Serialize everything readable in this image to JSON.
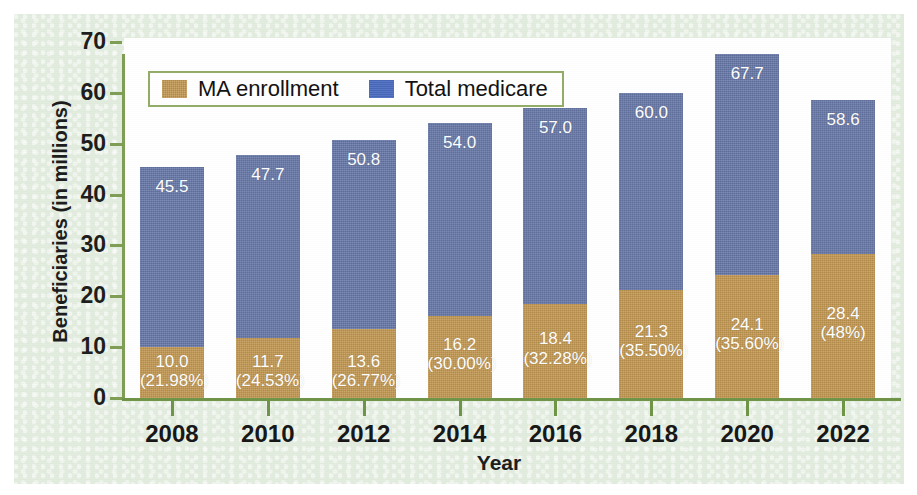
{
  "figure": {
    "background_color": "#e3eddf",
    "plot_background_color": "#ffffff",
    "axis_color": "#7f9e54"
  },
  "legend": {
    "position": "top-left-inside",
    "border_color": "#93ad68",
    "items": [
      {
        "label": "MA enrollment",
        "color": "#c3974f",
        "swatch": "tan-swatch-icon"
      },
      {
        "label": "Total medicare",
        "color": "#4a6bc0",
        "swatch": "blue-swatch-icon"
      }
    ]
  },
  "chart_data": {
    "type": "bar",
    "subtype": "stacked",
    "title": "",
    "xlabel": "Year",
    "ylabel": "Beneficiaries (in millions)",
    "ylim": [
      0,
      70
    ],
    "yticks": [
      0,
      10,
      20,
      30,
      40,
      50,
      60,
      70
    ],
    "ytick_labels": [
      "0",
      "10",
      "20",
      "30",
      "40",
      "50",
      "60",
      "70"
    ],
    "grid": false,
    "legend_position": "upper left",
    "categories": [
      "2008",
      "2010",
      "2012",
      "2014",
      "2016",
      "2018",
      "2020",
      "2022"
    ],
    "series": [
      {
        "name": "MA enrollment",
        "color": "#c3974f",
        "values": [
          10.0,
          11.7,
          13.6,
          16.2,
          18.4,
          21.3,
          24.1,
          28.4
        ],
        "value_labels": [
          "10.0",
          "11.7",
          "13.6",
          "16.2",
          "18.4",
          "21.3",
          "24.1",
          "28.4"
        ],
        "percent_labels": [
          "(21.98%)",
          "(24.53%)",
          "(26.77%)",
          "(30.00%)",
          "(32.28%)",
          "(35.50%)",
          "(35.60%)",
          "(48%)"
        ],
        "percents": [
          21.98,
          24.53,
          26.77,
          30.0,
          32.28,
          35.5,
          35.6,
          48.0
        ]
      },
      {
        "name": "Total medicare",
        "color": "#6778a8",
        "values": [
          45.5,
          47.7,
          50.8,
          54.0,
          57.0,
          60.0,
          67.7,
          58.6
        ],
        "value_labels": [
          "45.5",
          "47.7",
          "50.8",
          "54.0",
          "57.0",
          "60.0",
          "67.7",
          "58.6"
        ]
      }
    ]
  }
}
